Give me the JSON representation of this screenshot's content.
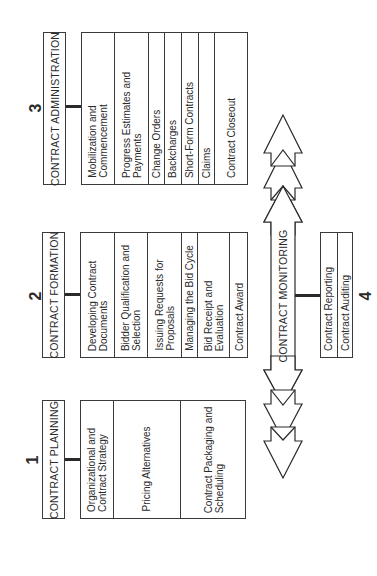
{
  "diagram": {
    "orientation": "rotated-90-ccw",
    "phases": [
      {
        "number": "1",
        "title": "CONTRACT PLANNING",
        "items": [
          "Organizational and\nContract Strategy",
          "Pricing Alternatives",
          "Contract Packaging and\nScheduling"
        ]
      },
      {
        "number": "2",
        "title": "CONTRACT FORMATION",
        "items": [
          "Developing Contract\nDocuments",
          "Bidder Qualification and\nSelection",
          "Issuing Requests for\nProposals",
          "Managing the Bid Cycle",
          "Bid Receipt and\nEvaluation",
          "Contract Award"
        ]
      },
      {
        "number": "3",
        "title": "CONTRACT ADMINISTRATION",
        "items": [
          "Mobilization and\nCommencement",
          "Progress Estimates and\nPayments",
          "Change Orders",
          "Backcharges",
          "Short-Form Contracts",
          "Claims",
          "Contract Closeout"
        ]
      }
    ],
    "monitoring": {
      "number": "4",
      "arrow_label": "CONTRACT MONITORING",
      "items": [
        "Contract Reporting",
        "Contract Auditing"
      ]
    }
  }
}
